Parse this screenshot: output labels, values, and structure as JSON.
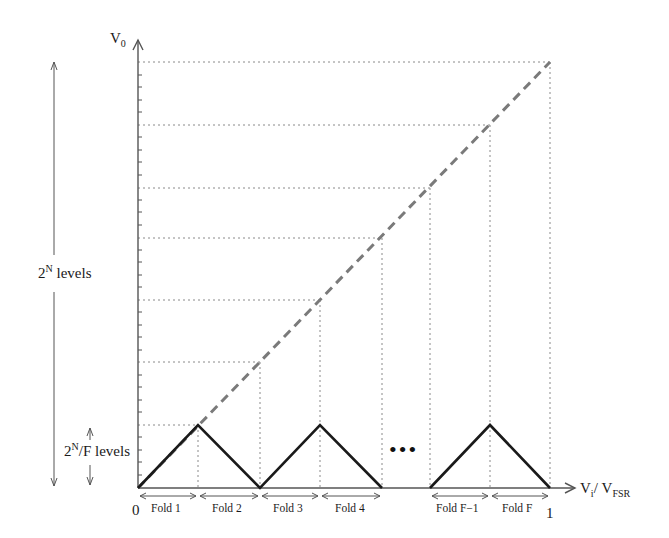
{
  "diagram": {
    "y_axis": {
      "label_main": "V",
      "label_sub": "0"
    },
    "x_axis": {
      "label_main": "V",
      "label_sub": "i",
      "slash": "/",
      "label_main2": "V",
      "label_sub2": "FSR",
      "tick_start": "0",
      "tick_end": "1"
    },
    "left_annotations": {
      "total_levels": {
        "base": "2",
        "exp": "N",
        "suffix": " levels"
      },
      "fold_levels": {
        "base": "2",
        "exp": "N",
        "suffix": "/F levels"
      }
    },
    "folds": [
      "Fold 1",
      "Fold 2",
      "Fold 3",
      "Fold 4",
      "Fold F−1",
      "Fold F"
    ],
    "ellipsis": "•••",
    "colors": {
      "axis": "#555555",
      "fold_line": "#1a1a1a",
      "ideal_line": "#7a7a7a",
      "grid": "#8a8a8a"
    }
  }
}
